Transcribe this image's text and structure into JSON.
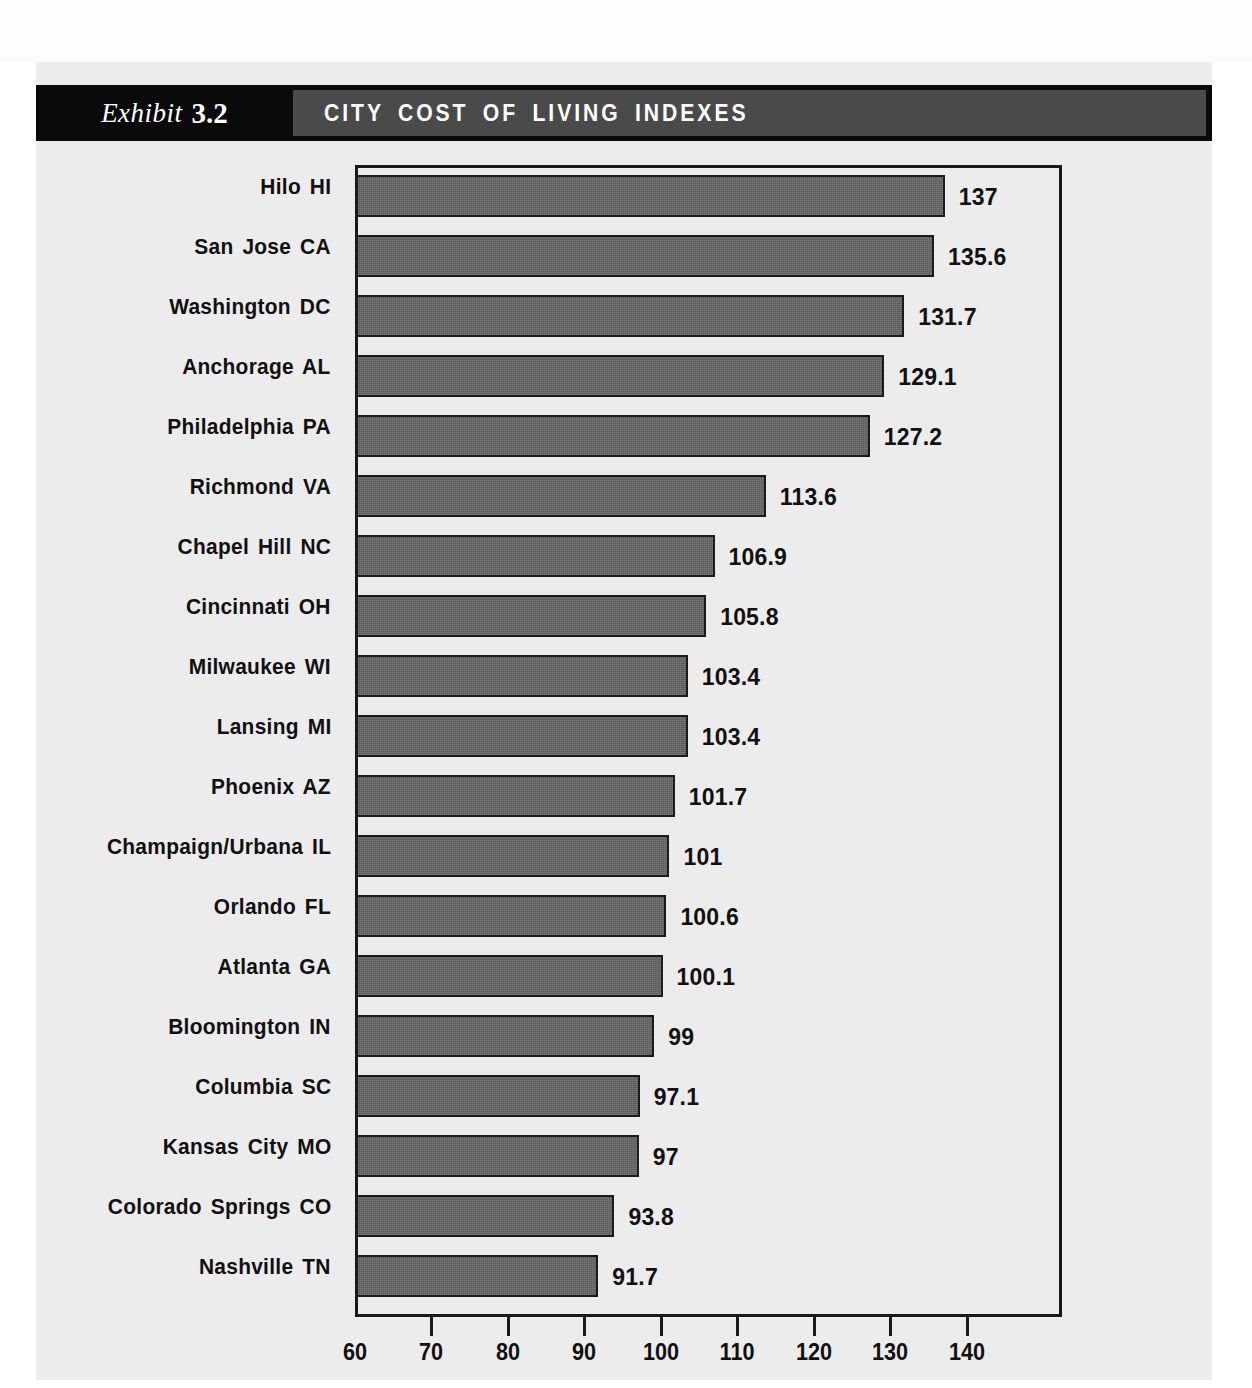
{
  "header": {
    "exhibit_word": "Exhibit",
    "exhibit_number": "3.2",
    "title": "CITY COST OF LIVING INDEXES"
  },
  "chart_data": {
    "type": "bar",
    "orientation": "horizontal",
    "title": "CITY COST OF LIVING INDEXES",
    "xlabel": "",
    "ylabel": "",
    "xlim": [
      60,
      145
    ],
    "xticks": [
      60,
      70,
      80,
      90,
      100,
      110,
      120,
      130,
      140
    ],
    "xtick_labels": [
      "60",
      "70",
      "80",
      "90",
      "100",
      "110",
      "120",
      "130",
      "140"
    ],
    "grid": false,
    "legend": false,
    "bar_color": "#585858",
    "bar_border_color": "#1b1b1b",
    "categories": [
      "Hilo HI",
      "San Jose CA",
      "Washington DC",
      "Anchorage AL",
      "Philadelphia PA",
      "Richmond VA",
      "Chapel Hill NC",
      "Cincinnati OH",
      "Milwaukee WI",
      "Lansing MI",
      "Phoenix AZ",
      "Champaign/Urbana IL",
      "Orlando FL",
      "Atlanta GA",
      "Bloomington IN",
      "Columbia SC",
      "Kansas City MO",
      "Colorado Springs CO",
      "Nashville TN"
    ],
    "values": [
      137,
      135.6,
      131.7,
      129.1,
      127.2,
      113.6,
      106.9,
      105.8,
      103.4,
      103.4,
      101.7,
      101,
      100.6,
      100.1,
      99,
      97.1,
      97,
      93.8,
      91.7
    ],
    "value_labels": [
      "137",
      "135.6",
      "131.7",
      "129.1",
      "127.2",
      "113.6",
      "106.9",
      "105.8",
      "103.4",
      "103.4",
      "101.7",
      "101",
      "100.6",
      "100.1",
      "99",
      "97.1",
      "97",
      "93.8",
      "91.7"
    ]
  }
}
